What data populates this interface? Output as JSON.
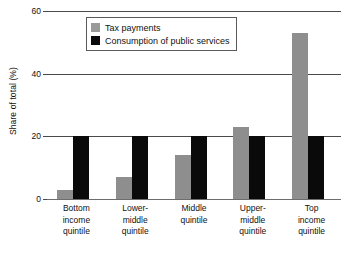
{
  "chart_data": {
    "type": "bar",
    "title": "",
    "xlabel": "",
    "ylabel": "Share of total (%)",
    "ylim": [
      0,
      60
    ],
    "yticks": [
      0,
      20,
      40,
      60
    ],
    "ytick_labels": [
      "0",
      "20",
      "40",
      "60"
    ],
    "grid": true,
    "legend_position": "top-left-inside",
    "categories": [
      "Bottom income quintile",
      "Lower-middle quintile",
      "Middle quintile",
      "Upper-middle quintile",
      "Top income quintile"
    ],
    "category_lines": [
      [
        "Bottom",
        "income",
        "quintile"
      ],
      [
        "Lower-",
        "middle",
        "quintile"
      ],
      [
        "Middle",
        "quintile"
      ],
      [
        "Upper-",
        "middle",
        "quintile"
      ],
      [
        "Top",
        "income",
        "quintile"
      ]
    ],
    "series": [
      {
        "name": "Tax payments",
        "color": "#8e8e8e",
        "values": [
          3,
          7,
          14,
          23,
          53
        ]
      },
      {
        "name": "Consumption of public services",
        "color": "#0a0a0a",
        "values": [
          20,
          20,
          20,
          20,
          20
        ]
      }
    ]
  },
  "legend": {
    "items": [
      {
        "label": "Tax payments",
        "swatch": "tax"
      },
      {
        "label": "Consumption of public services",
        "swatch": "consumption"
      }
    ]
  },
  "axes": {
    "y_title": "Share of total (%)"
  }
}
